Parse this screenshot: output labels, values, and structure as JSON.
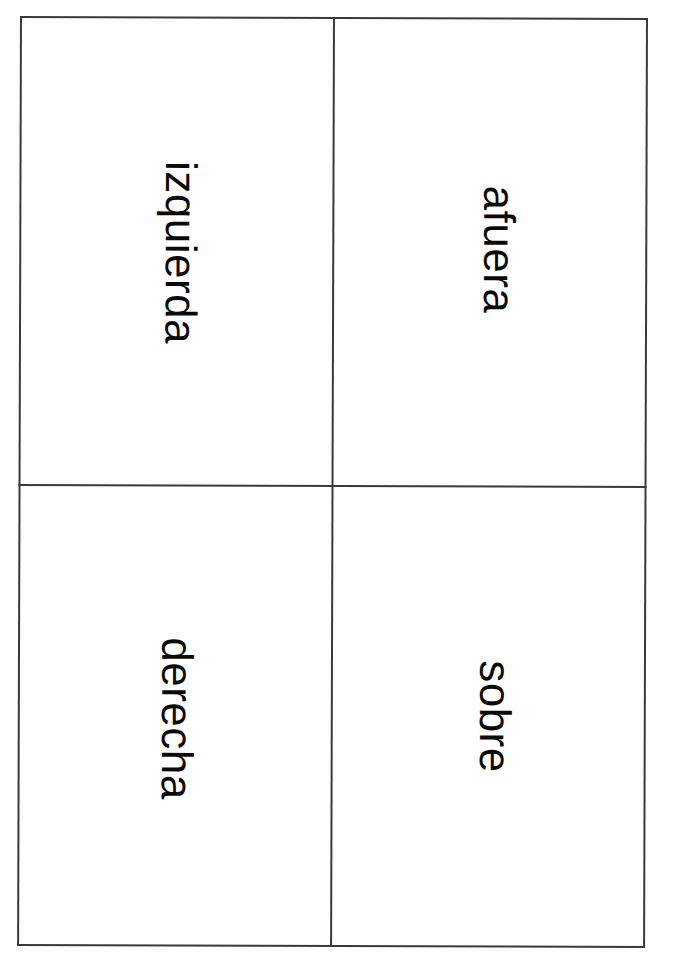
{
  "document": {
    "type": "printable-flashcard-sheet",
    "language": "Spanish",
    "background_color": "#ffffff",
    "ink_color": "#0a0a0a",
    "rule_color": "#3a3a3a",
    "grid": {
      "rows": 2,
      "columns": 2
    },
    "text_orientation": "rotated-90-clockwise"
  },
  "cards": [
    {
      "position": "top-left",
      "word": "izquierda"
    },
    {
      "position": "top-right",
      "word": "afuera"
    },
    {
      "position": "bottom-left",
      "word": "derecha"
    },
    {
      "position": "bottom-right",
      "word": "sobre"
    }
  ]
}
